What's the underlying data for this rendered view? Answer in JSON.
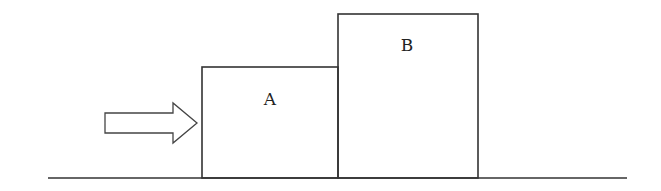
{
  "diagram": {
    "blocks": [
      {
        "id": "A",
        "label": "A",
        "x": 202,
        "y": 67,
        "width": 136,
        "height": 111
      },
      {
        "id": "B",
        "label": "B",
        "x": 338,
        "y": 14,
        "width": 140,
        "height": 164
      }
    ],
    "force_arrow": {
      "direction": "right",
      "icon": "arrow-right-icon"
    },
    "ground": {
      "x1": 48,
      "x2": 627,
      "y": 178
    },
    "colors": {
      "stroke": "#333333",
      "background": "#ffffff"
    }
  }
}
